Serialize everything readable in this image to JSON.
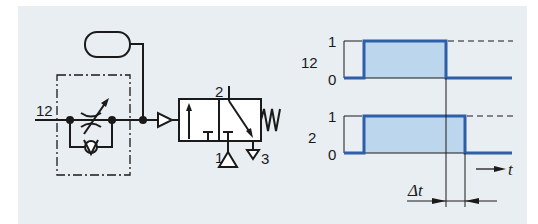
{
  "circuit": {
    "input_port_label": "12",
    "valve_ports": {
      "output": "2",
      "supply": "1",
      "exhaust": "3"
    },
    "components": [
      "reservoir",
      "throttle-check-valve",
      "3/2-way-valve",
      "spring-return"
    ]
  },
  "timing_diagram": {
    "signals": [
      {
        "name": "12",
        "high_label": "1",
        "low_label": "0"
      },
      {
        "name": "2",
        "high_label": "1",
        "low_label": "0"
      }
    ],
    "time_axis_label": "t",
    "delay_label": "Δt"
  },
  "colors": {
    "background": "#e9eef2",
    "signal_line": "#2f5ea8",
    "signal_fill": "#bcd6ee",
    "ink": "#1a1a1a"
  }
}
